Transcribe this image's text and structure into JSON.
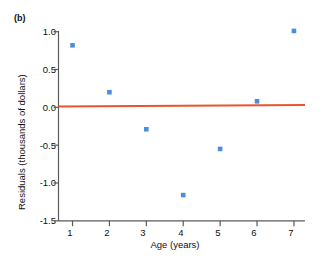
{
  "figure": {
    "panel_label": "(b)",
    "background_color": "#ffffff"
  },
  "chart_data": {
    "type": "scatter",
    "title": "",
    "panel": "(b)",
    "xlabel": "Age (years)",
    "ylabel": "Residuals (thousands of dollars)",
    "x": [
      1,
      2,
      3,
      4,
      5,
      6,
      7
    ],
    "values": [
      0.82,
      0.2,
      -0.29,
      -1.16,
      -0.55,
      0.08,
      1.01
    ],
    "series": [
      {
        "name": "Residuals",
        "marker": "square",
        "color": "#4a90d9",
        "x": [
          1,
          2,
          3,
          4,
          5,
          6,
          7
        ],
        "values": [
          0.82,
          0.2,
          -0.29,
          -1.16,
          -0.55,
          0.08,
          1.01
        ]
      },
      {
        "name": "Zero reference line",
        "type": "line",
        "color": "#e8542b",
        "x": [
          0.62,
          7.3
        ],
        "values": [
          0.01,
          0.03
        ]
      }
    ],
    "xlim": [
      0.62,
      7.3
    ],
    "ylim": [
      -1.5,
      1.0
    ],
    "xticks": [
      1,
      2,
      3,
      4,
      5,
      6,
      7
    ],
    "xticklabels": [
      "1",
      "2",
      "3",
      "4",
      "5",
      "6",
      "7"
    ],
    "yticks": [
      1.0,
      0.5,
      0.0,
      -0.5,
      -1.0,
      -1.5
    ],
    "yticklabels": [
      "1.0",
      "0.5",
      "0.0",
      "-0.5",
      "-1.0",
      "-1.5"
    ],
    "grid": false,
    "legend": "none",
    "axis_color": "#5a5a5a",
    "marker_color": "#4a90d9",
    "line_color": "#e8542b"
  }
}
